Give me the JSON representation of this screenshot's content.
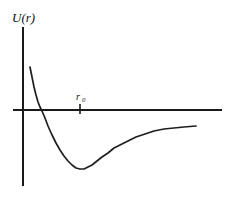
{
  "figure": {
    "name": "interatomic-potential-energy-curve",
    "background_color": "#ffffff",
    "ink_color": "#1a1a1a"
  },
  "labels": {
    "y_axis_label": "U(r)",
    "tick_label_base": "r",
    "tick_label_subscript": "0"
  },
  "chart_data": {
    "type": "line",
    "title": "",
    "xlabel": "",
    "ylabel": "U(r)",
    "grid": false,
    "legend": "none",
    "annotations": [
      {
        "text": "r",
        "subscript": "0",
        "kind": "x-axis-tick-label",
        "meaning": "equilibrium separation where U(r) is zero-crossing reference",
        "x_px": 80,
        "y_px": 96
      }
    ],
    "axes": {
      "y_axis": {
        "x_px": 23,
        "top_px": 27,
        "bottom_px": 186,
        "arrow": false
      },
      "x_axis": {
        "y_px": 110,
        "left_px": 13,
        "right_px": 222,
        "arrow": false
      },
      "origin_px": [
        23,
        110
      ],
      "xlim_note": "r increasing to the right, no numeric ticks",
      "ylim_note": "U(r) positive above axis, negative below axis"
    },
    "ticks": [
      {
        "axis": "x",
        "label": "r0",
        "x_px": 80,
        "from_y_px": 104,
        "to_y_px": 114
      }
    ],
    "series": [
      {
        "name": "U(r)",
        "description": "Lennard-Jones type interatomic potential: steep repulsive branch at small r, zero crossing, minimum well, then asymptotic rise toward zero",
        "points_px": [
          [
            30,
            67
          ],
          [
            32,
            77
          ],
          [
            34,
            87
          ],
          [
            36,
            95
          ],
          [
            38,
            102
          ],
          [
            40,
            107
          ],
          [
            42,
            111
          ],
          [
            45,
            118
          ],
          [
            48,
            126
          ],
          [
            52,
            135
          ],
          [
            56,
            143
          ],
          [
            60,
            150
          ],
          [
            64,
            156
          ],
          [
            68,
            161
          ],
          [
            72,
            165
          ],
          [
            76,
            168
          ],
          [
            80,
            169
          ],
          [
            84,
            169
          ],
          [
            88,
            167
          ],
          [
            92,
            165
          ],
          [
            97,
            161
          ],
          [
            102,
            157
          ],
          [
            108,
            153
          ],
          [
            114,
            148
          ],
          [
            120,
            145
          ],
          [
            128,
            141
          ],
          [
            136,
            137
          ],
          [
            145,
            134
          ],
          [
            154,
            131
          ],
          [
            164,
            129
          ],
          [
            174,
            128
          ],
          [
            184,
            127
          ],
          [
            196,
            126
          ]
        ],
        "key_features": {
          "curve_start": [
            30,
            67
          ],
          "zero_crossing": [
            42,
            110
          ],
          "minimum": [
            80,
            169
          ],
          "curve_end": [
            196,
            126
          ]
        }
      }
    ]
  }
}
